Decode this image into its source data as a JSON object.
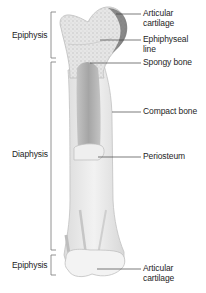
{
  "diagram": {
    "left_labels": {
      "epiphysis_top": "Epiphysis",
      "diaphysis": "Diaphysis",
      "epiphysis_bottom": "Epiphysis"
    },
    "right_labels": {
      "articular_cartilage_top": "Articular cartilage",
      "epiphyseal_line": "Ephiphyseal line",
      "spongy_bone": "Spongy bone",
      "compact_bone": "Compact bone",
      "periosteum": "Periosteum",
      "articular_cartilage_bottom": "Articular cartilage"
    },
    "colors": {
      "bone_fill": "#ececec",
      "bone_outline": "#bdbdbd",
      "marrow_cavity": "#a9a9a9",
      "cartilage_edge": "#555555",
      "leader_lines": "#444444",
      "brackets": "#666666"
    }
  }
}
